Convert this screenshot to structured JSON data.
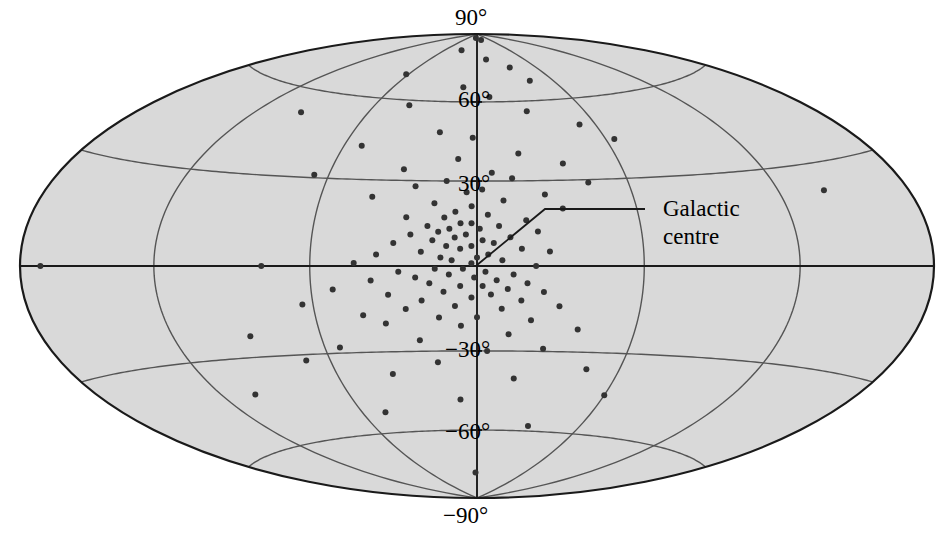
{
  "figure": {
    "kind": "sky-map",
    "projection": "Hammer-Aitoff",
    "coordinate_system": "galactic",
    "background_fill": "#d9d9d9",
    "outline_color": "#1a1a1a",
    "graticule_color": "#555555",
    "point_color": "#333333"
  },
  "annotations": {
    "galactic_centre_line1": "Galactic",
    "galactic_centre_line2": "centre"
  },
  "chart_data": {
    "type": "scatter",
    "title": "",
    "xlabel": "",
    "ylabel": "",
    "projection": "Hammer-Aitoff (equal-area, full sky)",
    "coordinate_system": "galactic",
    "grid": true,
    "legend": false,
    "xlim": [
      -180,
      180
    ],
    "ylim": [
      -90,
      90
    ],
    "latitude_ticks": [
      90,
      60,
      30,
      -30,
      -60,
      -90
    ],
    "latitude_tick_labels": [
      "90°",
      "60°",
      "30°",
      "−30°",
      "−60°",
      "−90°"
    ],
    "latitude_gridlines": [
      60,
      30,
      0,
      -30,
      -60
    ],
    "longitude_gridlines": [
      -120,
      -60,
      0,
      60,
      120
    ],
    "annotations": [
      {
        "text": "Galactic centre",
        "l": 0,
        "b": 0,
        "leader": true
      }
    ],
    "series": [
      {
        "name": "sources",
        "marker": "filled-circle",
        "marker_size_px": 6,
        "count": 126,
        "points_lb": [
          [
            -8,
            88
          ],
          [
            20,
            87
          ],
          [
            -30,
            82
          ],
          [
            12,
            78
          ],
          [
            34,
            74
          ],
          [
            -62,
            70
          ],
          [
            42,
            68
          ],
          [
            -10,
            66
          ],
          [
            8,
            62
          ],
          [
            -40,
            58
          ],
          [
            28,
            56
          ],
          [
            -96,
            52
          ],
          [
            52,
            50
          ],
          [
            -18,
            48
          ],
          [
            -2,
            46
          ],
          [
            64,
            44
          ],
          [
            -52,
            42
          ],
          [
            18,
            40
          ],
          [
            -8,
            38
          ],
          [
            36,
            36
          ],
          [
            -30,
            34
          ],
          [
            6,
            33
          ],
          [
            -66,
            31
          ],
          [
            14,
            31
          ],
          [
            -12,
            30
          ],
          [
            44,
            29
          ],
          [
            -24,
            28
          ],
          [
            2,
            27
          ],
          [
            -4,
            26
          ],
          [
            26,
            25
          ],
          [
            -40,
            24
          ],
          [
            10,
            23
          ],
          [
            -16,
            22
          ],
          [
            -2,
            21
          ],
          [
            32,
            20
          ],
          [
            -8,
            19
          ],
          [
            4,
            18
          ],
          [
            -26,
            17
          ],
          [
            -12,
            17
          ],
          [
            18,
            16
          ],
          [
            -6,
            15
          ],
          [
            -2,
            15
          ],
          [
            8,
            14
          ],
          [
            -18,
            14
          ],
          [
            -10,
            13
          ],
          [
            1,
            13
          ],
          [
            -14,
            12
          ],
          [
            22,
            12
          ],
          [
            -4,
            11
          ],
          [
            -24,
            11
          ],
          [
            12,
            10
          ],
          [
            -8,
            10
          ],
          [
            2,
            9
          ],
          [
            -16,
            9
          ],
          [
            -30,
            8
          ],
          [
            6,
            8
          ],
          [
            -2,
            7
          ],
          [
            -11,
            7
          ],
          [
            16,
            6
          ],
          [
            -6,
            6
          ],
          [
            -20,
            5
          ],
          [
            26,
            5
          ],
          [
            -36,
            4
          ],
          [
            4,
            4
          ],
          [
            -13,
            3
          ],
          [
            0,
            3
          ],
          [
            -9,
            2
          ],
          [
            9,
            2
          ],
          [
            -2,
            1
          ],
          [
            -44,
            1
          ],
          [
            -78,
            0
          ],
          [
            -170,
            0
          ],
          [
            21,
            0
          ],
          [
            -5,
            -1
          ],
          [
            -15,
            -1
          ],
          [
            3,
            -2
          ],
          [
            -28,
            -2
          ],
          [
            -10,
            -3
          ],
          [
            13,
            -3
          ],
          [
            -1,
            -4
          ],
          [
            -22,
            -4
          ],
          [
            7,
            -5
          ],
          [
            -38,
            -5
          ],
          [
            -17,
            -6
          ],
          [
            18,
            -6
          ],
          [
            -6,
            -7
          ],
          [
            2,
            -7
          ],
          [
            -52,
            -8
          ],
          [
            11,
            -8
          ],
          [
            -12,
            -9
          ],
          [
            24,
            -9
          ],
          [
            -32,
            -10
          ],
          [
            5,
            -10
          ],
          [
            -2,
            -11
          ],
          [
            -20,
            -12
          ],
          [
            16,
            -12
          ],
          [
            -64,
            -13
          ],
          [
            -8,
            -14
          ],
          [
            30,
            -14
          ],
          [
            -26,
            -15
          ],
          [
            9,
            -15
          ],
          [
            -42,
            -17
          ],
          [
            0,
            -18
          ],
          [
            -14,
            -18
          ],
          [
            20,
            -19
          ],
          [
            -34,
            -20
          ],
          [
            -6,
            -21
          ],
          [
            38,
            -22
          ],
          [
            -88,
            -23
          ],
          [
            12,
            -24
          ],
          [
            -22,
            -26
          ],
          [
            -54,
            -28
          ],
          [
            26,
            -29
          ],
          [
            4,
            -30
          ],
          [
            -70,
            -32
          ],
          [
            -16,
            -34
          ],
          [
            46,
            -36
          ],
          [
            -36,
            -38
          ],
          [
            16,
            -40
          ],
          [
            -104,
            -42
          ],
          [
            60,
            -45
          ],
          [
            -8,
            -48
          ],
          [
            -48,
            -52
          ],
          [
            30,
            -58
          ],
          [
            -2,
            -78
          ],
          [
            140,
            22
          ]
        ]
      }
    ]
  }
}
